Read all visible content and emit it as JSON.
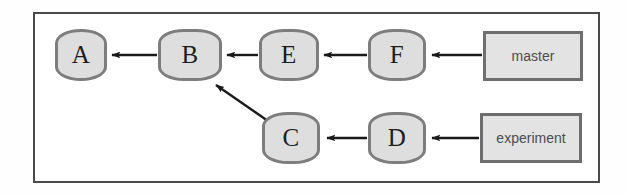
{
  "diagram": {
    "frame": {
      "border_color": "#4a4a4a"
    },
    "style": {
      "node_fill": "#dedede",
      "node_border": "#7d7d7d",
      "branch_fill": "#e3e3e3",
      "branch_border": "#6e6e6e",
      "edge_color": "#1a1a1a",
      "background": "#ffffff"
    },
    "commits": [
      {
        "id": "A",
        "label": "A",
        "x": 55,
        "y": 29,
        "w": 52,
        "h": 52
      },
      {
        "id": "B",
        "label": "B",
        "x": 158,
        "y": 29,
        "w": 64,
        "h": 52
      },
      {
        "id": "E",
        "label": "E",
        "x": 259,
        "y": 29,
        "w": 60,
        "h": 52
      },
      {
        "id": "F",
        "label": "F",
        "x": 368,
        "y": 29,
        "w": 58,
        "h": 52
      },
      {
        "id": "C",
        "label": "C",
        "x": 262,
        "y": 112,
        "w": 58,
        "h": 52
      },
      {
        "id": "D",
        "label": "D",
        "x": 368,
        "y": 112,
        "w": 58,
        "h": 52
      }
    ],
    "branches": [
      {
        "id": "master",
        "label": "master",
        "x": 483,
        "y": 31,
        "w": 100,
        "h": 50
      },
      {
        "id": "experiment",
        "label": "experiment",
        "x": 480,
        "y": 113,
        "w": 102,
        "h": 50
      }
    ],
    "edges": [
      {
        "id": "b-to-a",
        "from": "B",
        "to": "A",
        "kind": "parent"
      },
      {
        "id": "e-to-b",
        "from": "E",
        "to": "B",
        "kind": "parent"
      },
      {
        "id": "f-to-e",
        "from": "F",
        "to": "E",
        "kind": "parent"
      },
      {
        "id": "master-to-f",
        "from": "master",
        "to": "F",
        "kind": "branch-pointer"
      },
      {
        "id": "c-to-b",
        "from": "C",
        "to": "B",
        "kind": "parent"
      },
      {
        "id": "d-to-c",
        "from": "D",
        "to": "C",
        "kind": "parent"
      },
      {
        "id": "experiment-to-d",
        "from": "experiment",
        "to": "D",
        "kind": "branch-pointer"
      }
    ]
  }
}
